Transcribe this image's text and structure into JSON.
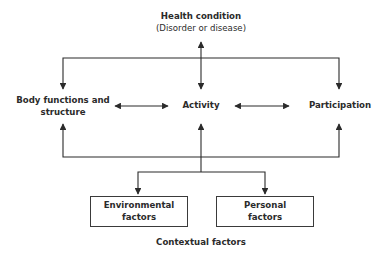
{
  "diagram": {
    "nodes": {
      "health_condition": {
        "line1": "Health condition",
        "line2": "(Disorder or disease)"
      },
      "body_functions": {
        "line1": "Body functions and",
        "line2": "structure"
      },
      "activity": {
        "label": "Activity"
      },
      "participation": {
        "label": "Participation"
      },
      "environmental": {
        "line1": "Environmental",
        "line2": "factors"
      },
      "personal": {
        "line1": "Personal",
        "line2": "factors"
      },
      "contextual": {
        "label": "Contextual factors"
      }
    },
    "edges": [
      {
        "from": "health_condition",
        "to": "activity",
        "type": "bidirectional"
      },
      {
        "from": "health_condition",
        "to": "body_functions",
        "type": "arrow"
      },
      {
        "from": "health_condition",
        "to": "participation",
        "type": "arrow"
      },
      {
        "from": "body_functions",
        "to": "activity",
        "type": "bidirectional"
      },
      {
        "from": "activity",
        "to": "participation",
        "type": "bidirectional"
      },
      {
        "from": "contextual",
        "to": "body_functions",
        "type": "arrow"
      },
      {
        "from": "contextual",
        "to": "activity",
        "type": "arrow"
      },
      {
        "from": "contextual",
        "to": "participation",
        "type": "arrow"
      },
      {
        "from": "contextual",
        "to": "environmental",
        "type": "arrow"
      },
      {
        "from": "contextual",
        "to": "personal",
        "type": "arrow"
      }
    ],
    "colors": {
      "line": "#2b2b2b",
      "text": "#2b2b2b",
      "background": "#ffffff"
    }
  }
}
